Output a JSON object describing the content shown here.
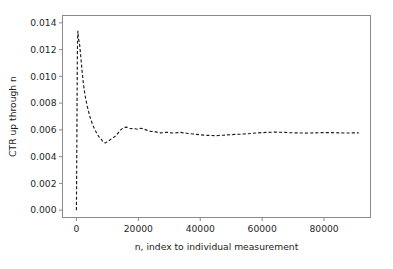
{
  "figure": {
    "background_color": "#ffffff",
    "line_color": "#1c1c1c",
    "axis_color": "#8a8a8a",
    "text_color": "#262626"
  },
  "chart_data": {
    "type": "line",
    "title": "",
    "xlabel": "n, index to individual measurement",
    "ylabel": "CTR up through n",
    "xlim": [
      -4500,
      95000
    ],
    "ylim": [
      -0.00055,
      0.01455
    ],
    "grid": false,
    "legend": null,
    "linestyle": "dashed",
    "color": "#1c1c1c",
    "xticks": [
      0,
      20000,
      40000,
      60000,
      80000
    ],
    "xticklabels": [
      "0",
      "20000",
      "40000",
      "60000",
      "80000"
    ],
    "yticks": [
      0.0,
      0.002,
      0.004,
      0.006,
      0.008,
      0.01,
      0.012,
      0.014
    ],
    "yticklabels": [
      "0.000",
      "0.002",
      "0.004",
      "0.006",
      "0.008",
      "0.010",
      "0.012",
      "0.014"
    ],
    "annotations": [
      "Cumulative click-through-rate converges to about 0.0058",
      "Initial spike peaks near 0.0134 at small n",
      "Minimum trough near 0.0050 around n = 8500"
    ],
    "x": [
      0,
      120,
      200,
      260,
      320,
      380,
      430,
      470,
      520,
      570,
      620,
      680,
      740,
      800,
      880,
      960,
      1050,
      1150,
      1260,
      1380,
      1500,
      1650,
      1800,
      1950,
      2100,
      2300,
      2500,
      2700,
      2900,
      3150,
      3400,
      3650,
      3900,
      4200,
      4500,
      4800,
      5100,
      5450,
      5800,
      6150,
      6500,
      6900,
      7300,
      7700,
      8100,
      8500,
      8900,
      9300,
      9700,
      10100,
      10500,
      11000,
      11500,
      12000,
      12500,
      13000,
      13500,
      14000,
      14500,
      15000,
      15500,
      16000,
      16600,
      17200,
      17800,
      18400,
      19000,
      19600,
      20200,
      20800,
      21400,
      22000,
      22700,
      23400,
      24100,
      24800,
      25600,
      26400,
      27200,
      28000,
      28900,
      29800,
      30700,
      31600,
      32600,
      33600,
      34600,
      35600,
      36700,
      37800,
      38900,
      40000,
      41200,
      42400,
      43600,
      44800,
      46000,
      47300,
      48600,
      49900,
      51200,
      52600,
      54000,
      55400,
      56800,
      58200,
      59700,
      61200,
      62700,
      64200,
      65800,
      67400,
      69000,
      70600,
      72300,
      74000,
      75700,
      77400,
      79200,
      81000,
      82800,
      84600,
      86500,
      88400,
      90300,
      91200
    ],
    "y": [
      0.0,
      0.0044,
      0.0079,
      0.0103,
      0.0119,
      0.0128,
      0.0132,
      0.0134,
      0.01325,
      0.01305,
      0.0129,
      0.0128,
      0.01272,
      0.01268,
      0.0126,
      0.01248,
      0.01232,
      0.0121,
      0.01185,
      0.01155,
      0.01122,
      0.01085,
      0.01048,
      0.01012,
      0.00978,
      0.00938,
      0.00902,
      0.00872,
      0.00845,
      0.00815,
      0.00788,
      0.00762,
      0.00738,
      0.00712,
      0.00688,
      0.00668,
      0.00648,
      0.00628,
      0.00608,
      0.00592,
      0.00578,
      0.00562,
      0.00548,
      0.00538,
      0.00528,
      0.00512,
      0.00504,
      0.00502,
      0.00508,
      0.00515,
      0.00521,
      0.00528,
      0.00536,
      0.00544,
      0.00552,
      0.00562,
      0.00578,
      0.00594,
      0.00604,
      0.00612,
      0.00618,
      0.00621,
      0.00618,
      0.00612,
      0.00609,
      0.00611,
      0.00608,
      0.00605,
      0.00608,
      0.00612,
      0.00609,
      0.00604,
      0.00598,
      0.00592,
      0.00588,
      0.00589,
      0.00585,
      0.00581,
      0.00578,
      0.00579,
      0.00582,
      0.00581,
      0.00578,
      0.00576,
      0.00579,
      0.00581,
      0.00578,
      0.00575,
      0.00572,
      0.00569,
      0.00566,
      0.00563,
      0.00561,
      0.00559,
      0.00558,
      0.00557,
      0.00558,
      0.0056,
      0.00562,
      0.00564,
      0.00566,
      0.00567,
      0.00569,
      0.00571,
      0.00574,
      0.00577,
      0.00579,
      0.00581,
      0.00582,
      0.00583,
      0.00582,
      0.00581,
      0.00579,
      0.00578,
      0.00577,
      0.00576,
      0.00577,
      0.00578,
      0.00579,
      0.0058,
      0.00579,
      0.00578,
      0.00577,
      0.00577,
      0.00578,
      0.00578
    ]
  }
}
